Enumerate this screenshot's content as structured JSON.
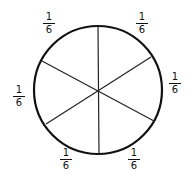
{
  "diagram": {
    "type": "fraction-circle",
    "parts": 6,
    "circle": {
      "cx": 98,
      "cy": 90,
      "r": 64,
      "stroke": "#111111"
    },
    "labels": [
      {
        "id": "top-left",
        "numerator": "1",
        "denominator": "6",
        "x": 41,
        "y": 12
      },
      {
        "id": "top-right",
        "numerator": "1",
        "denominator": "6",
        "x": 134,
        "y": 12
      },
      {
        "id": "right",
        "numerator": "1",
        "denominator": "6",
        "x": 167,
        "y": 72
      },
      {
        "id": "left",
        "numerator": "1",
        "denominator": "6",
        "x": 11,
        "y": 85
      },
      {
        "id": "bottom-left",
        "numerator": "1",
        "denominator": "6",
        "x": 58,
        "y": 148
      },
      {
        "id": "bottom-right",
        "numerator": "1",
        "denominator": "6",
        "x": 126,
        "y": 148
      }
    ]
  }
}
